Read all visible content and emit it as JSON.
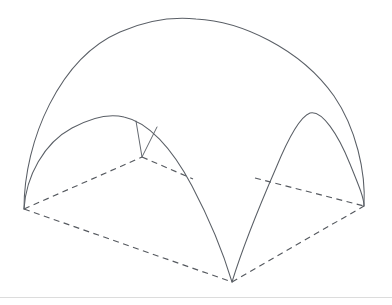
{
  "figure": {
    "title": "Isometric line drawing of a four-point arched canopy dome",
    "background_color": "#ffffff",
    "line_color": "#5a5f66",
    "dashed_line_color": "#55595f",
    "footer_rule_color": "#dcdcdc",
    "canvas": {
      "width": 392,
      "height": 305
    }
  },
  "geometry": {
    "base": {
      "name": "base-rhombus",
      "style": "dashed",
      "vertices": {
        "left": {
          "label": "left-corner",
          "x": 24,
          "y": 209
        },
        "back": {
          "label": "back-corner",
          "x": 142,
          "y": 157
        },
        "right": {
          "label": "right-corner",
          "x": 364,
          "y": 206
        },
        "front": {
          "label": "front-corner",
          "x": 232,
          "y": 282
        }
      },
      "segments": [
        {
          "name": "base-edge-left-back",
          "d": "M 24 209 L 142 157"
        },
        {
          "name": "base-edge-back-right-a",
          "d": "M 142 157 L 193 179"
        },
        {
          "name": "base-edge-back-right-b",
          "d": "M 255 178 L 364 206"
        },
        {
          "name": "base-edge-left-front",
          "d": "M 24 209 L 232 282"
        },
        {
          "name": "base-edge-front-right",
          "d": "M 232 282 L 364 206"
        }
      ]
    },
    "outer_dome": {
      "name": "outer-dome-arch",
      "style": "solid",
      "apex": {
        "x": 196,
        "y": 19
      },
      "d": "M 24 209 C 24 140 60 58 120 32 C 152 18 176 17 196 19 C 240 21 300 48 334 96 C 356 128 366 172 364 206"
    },
    "front_left_arch": {
      "name": "front-left-arch",
      "style": "solid",
      "apex": {
        "x": 124,
        "y": 117
      },
      "d": "M 24 209 C 26 176 44 143 72 128 C 96 115 112 114 124 117 C 148 122 172 148 192 186 C 212 224 226 262 232 282"
    },
    "front_right_arch": {
      "name": "front-right-arch",
      "style": "solid",
      "apex": {
        "x": 310,
        "y": 113
      },
      "d": "M 232 282 C 240 256 256 214 276 168 C 290 134 302 116 310 113 C 322 110 338 134 350 164 C 359 186 364 198 364 206"
    },
    "struts": [
      {
        "name": "strut-left",
        "d": "M 136 121 L 142 157"
      },
      {
        "name": "strut-right",
        "d": "M 157 127 L 142 157"
      }
    ],
    "footer_rule": {
      "name": "footer-rule",
      "d": "M 0 297.5 L 392 297.5"
    }
  }
}
